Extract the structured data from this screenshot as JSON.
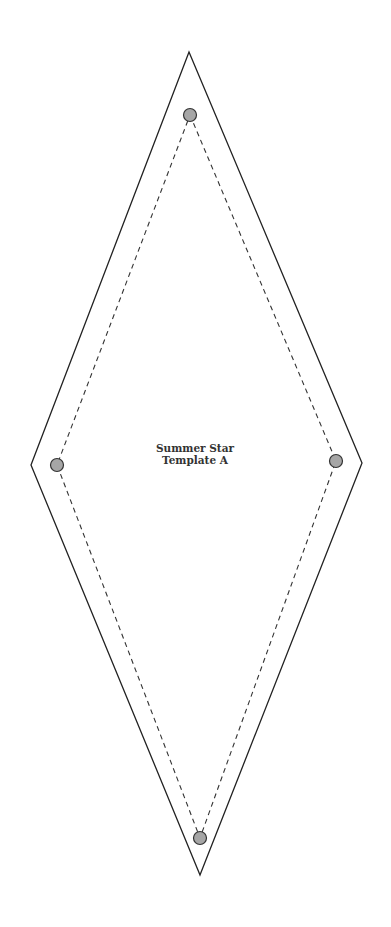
{
  "template": {
    "title_line1": "Summer Star",
    "title_line2": "Template A"
  },
  "colors": {
    "outline": "#222222",
    "seam": "#333333",
    "marker_fill": "#a6a6a6",
    "marker_stroke": "#333333",
    "text": "#333333"
  },
  "shape": {
    "type": "diamond",
    "outer_points": "189,52 362,463 200,875 31,465",
    "seam_points": "190,115 336,461 200,838 57,465"
  },
  "markers": [
    {
      "name": "top",
      "cx": 190,
      "cy": 115
    },
    {
      "name": "right",
      "cx": 336,
      "cy": 461
    },
    {
      "name": "bottom",
      "cx": 200,
      "cy": 838
    },
    {
      "name": "left",
      "cx": 57,
      "cy": 465
    }
  ]
}
